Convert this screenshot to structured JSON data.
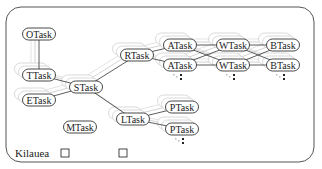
{
  "diagram": {
    "type": "task-graph",
    "frame": {
      "x": 6,
      "y": 7,
      "width": 308,
      "height": 155,
      "radius": 15,
      "stroke": "#555555"
    },
    "nodes": [
      {
        "id": "otask",
        "label": "OTask",
        "x": 39,
        "y": 34
      },
      {
        "id": "ttask",
        "label": "TTask",
        "x": 39,
        "y": 75
      },
      {
        "id": "etask",
        "label": "ETask",
        "x": 39,
        "y": 100
      },
      {
        "id": "stask",
        "label": "STask",
        "x": 86,
        "y": 87
      },
      {
        "id": "rtask",
        "label": "RTask",
        "x": 137,
        "y": 55
      },
      {
        "id": "mtask",
        "label": "MTask",
        "x": 80,
        "y": 127
      },
      {
        "id": "ltask",
        "label": "LTask",
        "x": 133,
        "y": 119
      },
      {
        "id": "atask1",
        "label": "ATask",
        "x": 180,
        "y": 45
      },
      {
        "id": "atask2",
        "label": "ATask",
        "x": 180,
        "y": 65
      },
      {
        "id": "wtask1",
        "label": "WTask",
        "x": 233,
        "y": 45
      },
      {
        "id": "wtask2",
        "label": "WTask",
        "x": 233,
        "y": 65
      },
      {
        "id": "btask1",
        "label": "BTask",
        "x": 283,
        "y": 45
      },
      {
        "id": "btask2",
        "label": "BTask",
        "x": 283,
        "y": 65
      },
      {
        "id": "ptask1",
        "label": "PTask",
        "x": 182,
        "y": 107
      },
      {
        "id": "ptask2",
        "label": "PTask",
        "x": 182,
        "y": 129
      }
    ],
    "edges": [
      [
        "otask",
        "ttask"
      ],
      [
        "ttask",
        "stask"
      ],
      [
        "etask",
        "stask"
      ],
      [
        "stask",
        "rtask"
      ],
      [
        "stask",
        "ltask"
      ],
      [
        "rtask",
        "atask1"
      ],
      [
        "rtask",
        "atask2"
      ],
      [
        "atask1",
        "wtask1"
      ],
      [
        "atask1",
        "wtask2"
      ],
      [
        "atask2",
        "wtask1"
      ],
      [
        "atask2",
        "wtask2"
      ],
      [
        "wtask1",
        "btask1"
      ],
      [
        "wtask1",
        "btask2"
      ],
      [
        "wtask2",
        "btask1"
      ],
      [
        "wtask2",
        "btask2"
      ],
      [
        "ltask",
        "ptask1"
      ],
      [
        "ltask",
        "ptask2"
      ]
    ],
    "continuation_markers": [
      {
        "x": 181,
        "y": 75
      },
      {
        "x": 234,
        "y": 75
      },
      {
        "x": 284,
        "y": 75
      },
      {
        "x": 183,
        "y": 139
      }
    ],
    "legend": {
      "label": "Kilauea",
      "label_x": 15,
      "label_y": 153,
      "boxes": [
        {
          "x": 61,
          "y": 149,
          "size": 8
        },
        {
          "x": 119,
          "y": 149,
          "size": 8
        }
      ]
    }
  }
}
